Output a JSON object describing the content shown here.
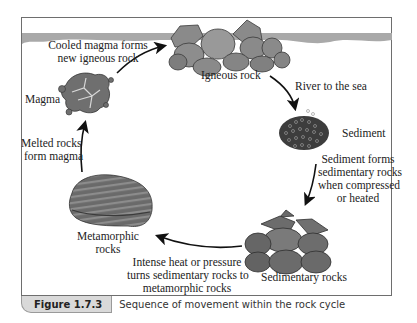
{
  "figure": {
    "caption_number": "Figure 1.7.3",
    "caption_text": "Sequence of movement within the rock cycle"
  },
  "stages": {
    "igneous": "Igneous rock",
    "sediment": "Sediment",
    "sedimentary": "Sedimentary rocks",
    "metamorphic_line1": "Metamorphic",
    "metamorphic_line2": "rocks",
    "magma": "Magma"
  },
  "processes": {
    "cooled_line1": "Cooled magma forms",
    "cooled_line2": "new igneous rock",
    "river": "River to the sea",
    "sediment_forms_line1": "Sediment forms",
    "sediment_forms_line2": "sedimentary rocks",
    "sediment_forms_line3": "when compressed",
    "sediment_forms_line4": "or heated",
    "heat_line1": "Intense heat or pressure",
    "heat_line2": "turns sedimentary rocks to",
    "heat_line3": "metamorphic rocks",
    "melted_line1": "Melted rocks",
    "melted_line2": "form magma"
  },
  "colors": {
    "frame": "#6e6e6e",
    "water": "#a9a9a9",
    "rock_fill": "#7d7d7d",
    "rock_dark": "#4a4a4a",
    "arrow": "#111111",
    "caption_tab": "#d9d9d9"
  }
}
